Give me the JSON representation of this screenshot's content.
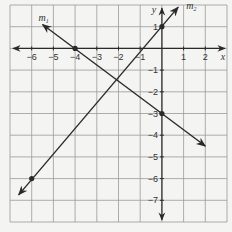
{
  "chart_data": {
    "type": "line",
    "title": "",
    "xlabel": "x",
    "ylabel": "y",
    "xlim": [
      -7,
      3
    ],
    "ylim": [
      -8,
      2
    ],
    "grid": true,
    "x_ticks": [
      "-6",
      "-5",
      "-4",
      "-3",
      "-2",
      "-1",
      "1",
      "2"
    ],
    "y_ticks": [
      "1",
      "-1",
      "-2",
      "-3",
      "-4",
      "-5",
      "-6",
      "-7"
    ],
    "series": [
      {
        "name": "m1",
        "label_main": "m",
        "label_sub": "1",
        "points": [
          [
            -4,
            0
          ],
          [
            0,
            -3
          ]
        ],
        "start": [
          -5.5,
          1.1
        ],
        "end": [
          2,
          -4.5
        ]
      },
      {
        "name": "m2",
        "label_main": "m",
        "label_sub": "2",
        "points": [
          [
            -6,
            -6
          ],
          [
            0,
            1
          ]
        ],
        "start": [
          0.75,
          1.9
        ],
        "end": [
          -6.6,
          -6.75
        ]
      }
    ]
  },
  "colors": {
    "grid": "#9a9a9a",
    "axis": "#2a2a2a",
    "line": "#2a2a2a",
    "background": "#f4f4f2"
  }
}
